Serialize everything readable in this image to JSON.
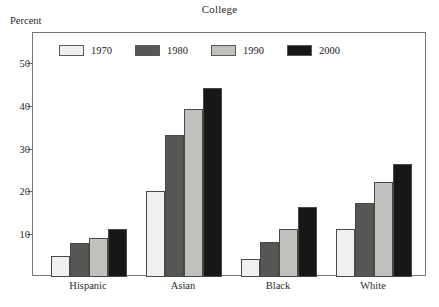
{
  "chart_data": {
    "type": "bar",
    "title": "College",
    "ylabel": "Percent",
    "xlabel": "",
    "categories": [
      "Hispanic",
      "Asian",
      "Black",
      "White"
    ],
    "series": [
      {
        "name": "1970",
        "color": "#f1f0ee",
        "values": [
          4.8,
          20.2,
          4.3,
          11.3
        ]
      },
      {
        "name": "1980",
        "color": "#585654",
        "values": [
          8.0,
          33.2,
          8.2,
          17.4
        ]
      },
      {
        "name": "1990",
        "color": "#c2c0bd",
        "values": [
          9.2,
          39.2,
          11.3,
          22.3
        ]
      },
      {
        "name": "2000",
        "color": "#171717",
        "values": [
          11.2,
          44.2,
          16.3,
          26.4
        ]
      }
    ],
    "ylim": [
      0,
      57
    ],
    "yticks": [
      10,
      20,
      30,
      40,
      50
    ],
    "ytick_labels": [
      "10",
      "20",
      "30",
      "40",
      "50"
    ],
    "grid": false,
    "legend_position": "top-left-inside",
    "axis_color": "#777472",
    "text_color": "#2b2b2b"
  }
}
